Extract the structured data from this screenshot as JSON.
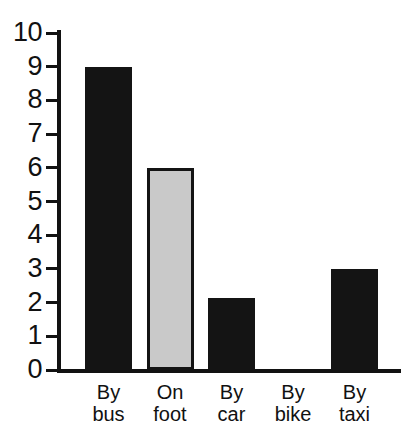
{
  "chart_data": {
    "type": "bar",
    "title": "",
    "subtitle": "",
    "xlabel": "",
    "ylabel": "",
    "categories": [
      "By bus",
      "On foot",
      "By car",
      "By bike",
      "By taxi"
    ],
    "category_lines": [
      [
        "By",
        "bus"
      ],
      [
        "On",
        "foot"
      ],
      [
        "By",
        "car"
      ],
      [
        "By",
        "bike"
      ],
      [
        "By",
        "taxi"
      ]
    ],
    "values": [
      9,
      6,
      2.15,
      0,
      3
    ],
    "ylim": [
      0,
      10
    ],
    "y_ticks": [
      0,
      1,
      2,
      3,
      4,
      5,
      6,
      7,
      8,
      9,
      10
    ],
    "y_tick_labels": [
      "0",
      "1",
      "2",
      "3",
      "4",
      "5",
      "6",
      "7",
      "8",
      "9",
      "10"
    ],
    "grid": false,
    "legend": null,
    "bar_styles": [
      "solid",
      "outlined",
      "solid",
      "solid",
      "solid"
    ],
    "colors": {
      "bar_solid": "#141414",
      "bar_fill_light": "#c9c9c9",
      "bar_outline": "#141414",
      "axis": "#121212",
      "text": "#111111",
      "background": "#ffffff"
    }
  }
}
